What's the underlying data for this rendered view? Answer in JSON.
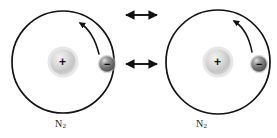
{
  "figure": {
    "kind": "physics-diagram",
    "background_color": "#ffffff",
    "stroke_color": "#111111",
    "nucleus_fill": "#c8c8c8",
    "nucleus_highlight": "#eaeaea",
    "electron_fill": "#6e6e6e",
    "electron_highlight": "#d0d0d0",
    "width": 277,
    "height": 138
  },
  "atoms": [
    {
      "id": "left-atom",
      "label": "N",
      "label_subscript": "2",
      "center": {
        "x": 63,
        "y": 62
      },
      "radius": 51,
      "nucleus": {
        "x": 63,
        "y": 62,
        "r": 13,
        "charge": "+"
      },
      "electron": {
        "x": 107,
        "y": 64,
        "r": 8,
        "charge": "−"
      },
      "orbit_arrow": {
        "direction": "counter-clockwise"
      }
    },
    {
      "id": "right-atom",
      "label": "N",
      "label_subscript": "2",
      "center": {
        "x": 218,
        "y": 62
      },
      "radius": 52,
      "nucleus": {
        "x": 218,
        "y": 62,
        "r": 13,
        "charge": "+"
      },
      "electron": {
        "x": 259,
        "y": 64,
        "r": 8,
        "charge": "−"
      },
      "orbit_arrow": {
        "direction": "counter-clockwise"
      }
    }
  ],
  "interaction_arrows": [
    {
      "id": "top-arrow",
      "style": "double-headed",
      "x1": 124,
      "x2": 159,
      "y": 15
    },
    {
      "id": "middle-arrow",
      "style": "double-headed",
      "x1": 124,
      "x2": 159,
      "y": 64
    }
  ],
  "labels": {
    "left_atom_label": "N",
    "left_atom_subscript": "2",
    "right_atom_label": "N",
    "right_atom_subscript": "2",
    "nucleus_charge": "+",
    "electron_charge": "−"
  }
}
